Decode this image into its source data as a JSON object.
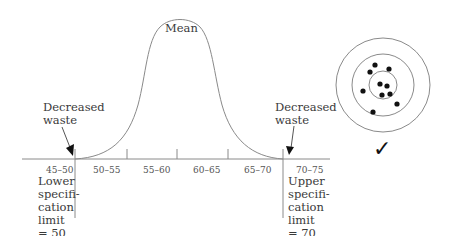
{
  "diagram": {
    "type": "normal-distribution-with-spec-limits",
    "curve_label": "Mean",
    "axis_bins": [
      "45–50",
      "50–55",
      "55–60",
      "60–65",
      "65–70",
      "70–75"
    ],
    "left_annotation": "Decreased waste",
    "right_annotation": "Decreased waste",
    "lower_limit_label": [
      "Lower",
      "specifi-",
      "cation",
      "limit",
      "= 50"
    ],
    "upper_limit_label": [
      "Upper",
      "specifi-",
      "cation",
      "limit",
      "= 70"
    ],
    "lower_limit_value": 50,
    "upper_limit_value": 70,
    "target": {
      "rings": 3,
      "hits": 10,
      "result_icon": "checkmark-icon",
      "result_glyph": "✓"
    },
    "colors": {
      "line": "#8a8a8a",
      "dots": "#111111",
      "text": "#3a3a3a"
    }
  }
}
